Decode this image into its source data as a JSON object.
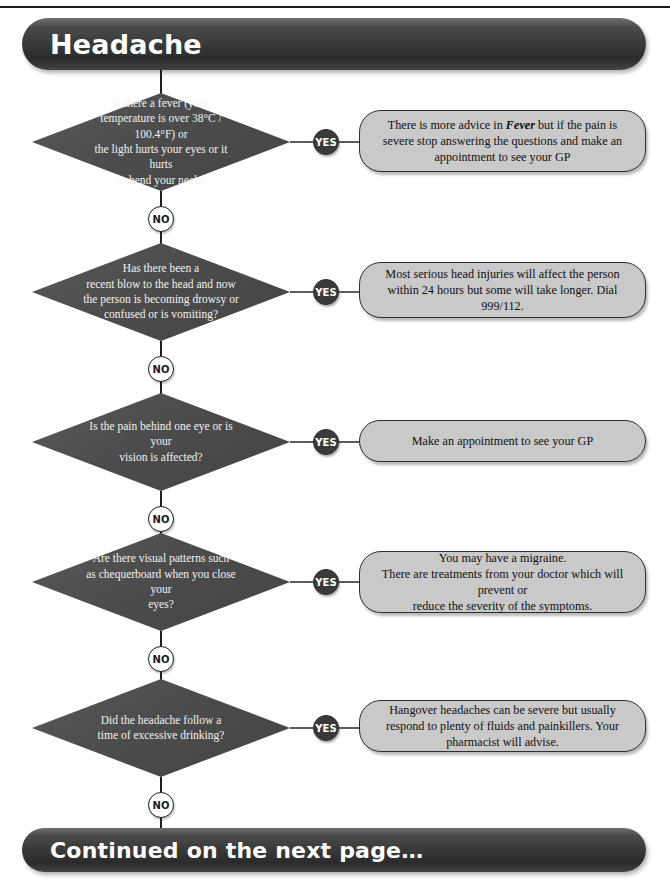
{
  "page": {
    "title": "Headache",
    "footer": "Continued on the next page…",
    "width": 670,
    "height": 887
  },
  "colors": {
    "banner_dark": "#3a3a3a",
    "diamond_fill": "#4f4f4f",
    "diamond_text": "#f2f2f2",
    "answer_fill": "#c9c9c9",
    "answer_border": "#2e2e2e",
    "badge_yes_fill": "#3a3a3a",
    "badge_no_fill": "#ffffff",
    "connector": "#1f1f1f"
  },
  "labels": {
    "yes": "YES",
    "no": "NO"
  },
  "chart_data": {
    "type": "diagram",
    "diagram_kind": "decision-flowchart",
    "title": "Headache",
    "footer": "Continued on the next page…",
    "orientation": "top-to-bottom, YES branches to the right, NO continues down",
    "node_count": 5,
    "steps": [
      {
        "index": 1,
        "question": "Is there a fever (your\ntemperature is over 38°C / 100.4°F) or\nthe light hurts your eyes or it hurts\nto bend your neck?",
        "yes": "There is more advice in <b>Fever</b> but if the pain is severe stop answering the questions and make an appointment to see your GP",
        "no": "NO"
      },
      {
        "index": 2,
        "question": "Has there been a\nrecent blow to the head and now\nthe person is becoming drowsy or\nconfused or is vomiting?",
        "yes": "Most serious head injuries will affect the person within 24 hours but some will take longer. Dial 999/112.",
        "no": "NO"
      },
      {
        "index": 3,
        "question": "Is the pain behind one eye or is your\nvision is affected?",
        "yes": "Make an appointment to see your GP",
        "no": "NO"
      },
      {
        "index": 4,
        "question": "Are there visual patterns such\nas chequerboard when you close your\neyes?",
        "yes": "You may have a migraine.\nThere are treatments from your doctor which will prevent or\nreduce the severity of the symptoms.",
        "no": "NO"
      },
      {
        "index": 5,
        "question": "Did the headache follow a\ntime of excessive drinking?",
        "yes": "Hangover headaches can be severe but usually respond to plenty of fluids and painkillers. Your pharmacist will advise.",
        "no": "NO"
      }
    ]
  },
  "steps": [
    {
      "question": "Is there a fever (your\ntemperature is over 38°C / 100.4°F) or\nthe light hurts your eyes or it hurts\nto bend your neck?",
      "answer_html": "There is more advice in <b>Fever</b> but if the pain is severe stop answering the questions and make an appointment to see your GP"
    },
    {
      "question": "Has there been a\nrecent blow to the head and now\nthe person is becoming drowsy or\nconfused or is vomiting?",
      "answer_html": "Most serious head injuries will affect the person within 24 hours but some will take longer. Dial 999/112."
    },
    {
      "question": "Is the pain behind one eye or is your\nvision is affected?",
      "answer_html": "Make an appointment to see your GP"
    },
    {
      "question": "Are there visual patterns such\nas chequerboard when you close your\neyes?",
      "answer_html": "You may have a migraine.\nThere are treatments from your doctor which will prevent or\nreduce the severity of the symptoms."
    },
    {
      "question": "Did the headache follow a\ntime of excessive drinking?",
      "answer_html": "Hangover headaches can be severe but usually respond to plenty of fluids and painkillers. Your pharmacist will advise."
    }
  ]
}
